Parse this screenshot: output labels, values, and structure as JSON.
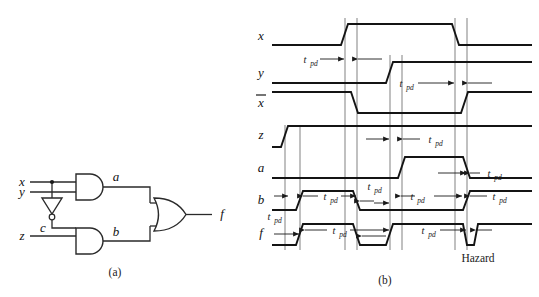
{
  "figure": {
    "caption_a": "(a)",
    "caption_b": "(b)",
    "hazard_label": "Hazard"
  },
  "circuit": {
    "inputs": [
      {
        "name": "x",
        "label": "x"
      },
      {
        "name": "y",
        "label": "y"
      },
      {
        "name": "z",
        "label": "z"
      }
    ],
    "nodes": [
      {
        "name": "c",
        "label": "c"
      },
      {
        "name": "a",
        "label": "a"
      },
      {
        "name": "b",
        "label": "b"
      }
    ],
    "output": {
      "name": "f",
      "label": "f"
    },
    "gates": [
      {
        "name": "and-gate-a",
        "type": "AND",
        "output": "a"
      },
      {
        "name": "inverter",
        "type": "NOT",
        "output": "c"
      },
      {
        "name": "and-gate-b",
        "type": "AND",
        "output": "b"
      },
      {
        "name": "or-gate-f",
        "type": "OR",
        "output": "f"
      }
    ]
  },
  "timing": {
    "signals": [
      {
        "name": "x",
        "label": "x",
        "overbar": false
      },
      {
        "name": "y",
        "label": "y",
        "overbar": false
      },
      {
        "name": "xbar",
        "label": "x",
        "overbar": true
      },
      {
        "name": "z",
        "label": "z",
        "overbar": false
      },
      {
        "name": "a",
        "label": "a",
        "overbar": false
      },
      {
        "name": "b",
        "label": "b",
        "overbar": false
      },
      {
        "name": "f",
        "label": "f",
        "overbar": false
      }
    ],
    "delay_label_main": "t",
    "delay_label_sub": "pd",
    "delay_annotations": [
      {
        "row": "x",
        "x": 312,
        "y": 62
      },
      {
        "row": "y",
        "x": 408,
        "y": 86
      },
      {
        "row": "z",
        "x": 432,
        "y": 142
      },
      {
        "row": "a",
        "x": 487,
        "y": 176
      },
      {
        "row": "b",
        "x": 302,
        "y": 199
      },
      {
        "row": "b",
        "x": 372,
        "y": 189
      },
      {
        "row": "b",
        "x": 411,
        "y": 199
      },
      {
        "row": "b",
        "x": 490,
        "y": 199
      },
      {
        "row": "f",
        "x": 272,
        "y": 219
      },
      {
        "row": "f",
        "x": 337,
        "y": 233
      },
      {
        "row": "f",
        "x": 426,
        "y": 233
      }
    ]
  },
  "colors": {
    "ink": "#141414",
    "gate_stroke": "#2a2a2a",
    "reference_line": "#4a4a4a",
    "background": "#ffffff"
  }
}
